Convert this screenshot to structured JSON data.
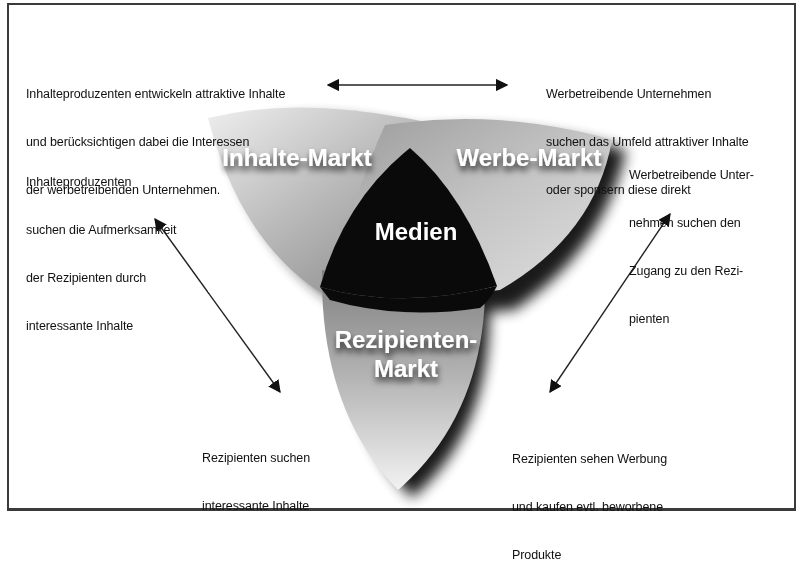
{
  "diagram": {
    "type": "three-sided media market",
    "center": {
      "label": "Medien"
    },
    "petals": [
      {
        "id": "inhalte",
        "label": "Inhalte-Markt",
        "position": "upper-left"
      },
      {
        "id": "werbe",
        "label": "Werbe-Markt",
        "position": "upper-right"
      },
      {
        "id": "rezipienten",
        "label_line1": "Rezipienten-",
        "label_line2": "Markt",
        "position": "bottom"
      }
    ],
    "colors": {
      "center": "#0a0a0a",
      "petal_light": "#e6e6e6",
      "petal_dark": "#8c8c8c",
      "shadow": "#000000",
      "frame": "#3a3a3a",
      "text": "#111111"
    },
    "arrows": [
      {
        "id": "top",
        "direction": "bidirectional",
        "from": "Inhalte-Markt",
        "to": "Werbe-Markt"
      },
      {
        "id": "left",
        "direction": "bidirectional",
        "from": "Inhalte-Markt",
        "to": "Rezipienten-Markt"
      },
      {
        "id": "right",
        "direction": "bidirectional",
        "from": "Werbe-Markt",
        "to": "Rezipienten-Markt"
      }
    ],
    "annotations": {
      "top_left": {
        "line1": "Inhalteproduzenten entwickeln attraktive Inhalte",
        "line2": "und berücksichtigen dabei die Interessen",
        "line3": "der werbetreibenden Unternehmen."
      },
      "top_right": {
        "line1": "Werbetreibende Unternehmen",
        "line2": "suchen das Umfeld attraktiver Inhalte",
        "line3": "oder sponsern diese direkt"
      },
      "mid_left": {
        "line1": "Inhalteproduzenten",
        "line2": "suchen die Aufmerksamkeit",
        "line3": "der Rezipienten durch",
        "line4": "interessante Inhalte"
      },
      "mid_right": {
        "line1": "Werbetreibende Unter-",
        "line2": "nehmen suchen den",
        "line3": "Zugang zu den Rezi-",
        "line4": "pienten"
      },
      "bottom_left": {
        "line1": "Rezipienten suchen",
        "line2": "interessante Inhalte"
      },
      "bottom_right": {
        "line1": "Rezipienten sehen Werbung",
        "line2": "und kaufen evtl. beworbene",
        "line3": "Produkte"
      }
    }
  }
}
